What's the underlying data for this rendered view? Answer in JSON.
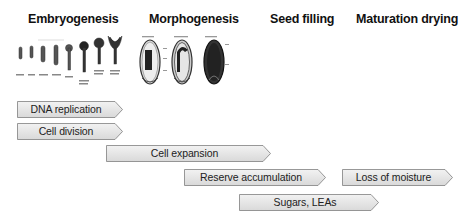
{
  "stages": [
    {
      "id": "embryogenesis",
      "title": "Embryogenesis"
    },
    {
      "id": "morphogenesis",
      "title": "Morphogenesis"
    },
    {
      "id": "seed-filling",
      "title": "Seed filling"
    },
    {
      "id": "maturation-drying",
      "title": "Maturation drying"
    }
  ],
  "processes": [
    {
      "id": "dna-replication",
      "label": "DNA replication"
    },
    {
      "id": "cell-division",
      "label": "Cell division"
    },
    {
      "id": "cell-expansion",
      "label": "Cell expansion"
    },
    {
      "id": "reserve-accumulation",
      "label": "Reserve accumulation"
    },
    {
      "id": "loss-of-moisture",
      "label": "Loss of moisture"
    },
    {
      "id": "sugars-leas",
      "label": "Sugars, LEAs"
    }
  ],
  "illustrations": {
    "embryo_stages": "embryo-development-series-illustration",
    "seed_sections": "seed-cross-section-illustration"
  },
  "colors": {
    "arrow_fill_top": "#f2f2f2",
    "arrow_fill_bottom": "#d9d9d9",
    "arrow_stroke": "#7f7f7f",
    "title_text": "#111111"
  }
}
